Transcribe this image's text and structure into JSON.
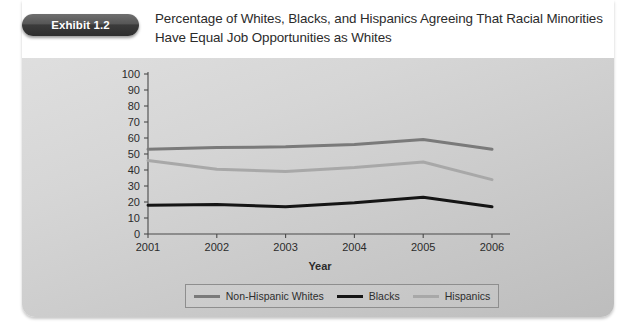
{
  "badge": {
    "label": "Exhibit 1.2"
  },
  "title": {
    "line1": "Percentage of Whites, Blacks, and Hispanics Agreeing That Racial Minorities",
    "line2": "Have Equal Job Opportunities as Whites"
  },
  "colors": {
    "whites": "#7a7a7a",
    "blacks": "#151515",
    "hispanics": "#a8a8a8",
    "axis": "#4a4a4a",
    "text": "#2b2b2b",
    "badge_bg": "#3b3b3b",
    "card_bg": "#d2d2d2"
  },
  "chart_data": {
    "type": "line",
    "title": "",
    "xlabel": "Year",
    "ylabel": "",
    "categories": [
      "2001",
      "2002",
      "2003",
      "2004",
      "2005",
      "2006"
    ],
    "ylim": [
      0,
      100
    ],
    "yticks": [
      0,
      10,
      20,
      30,
      40,
      50,
      60,
      70,
      80,
      90,
      100
    ],
    "ytick_labels": [
      "0",
      "10",
      "20",
      "30",
      "40",
      "50",
      "60",
      "70",
      "80",
      "90",
      "100"
    ],
    "grid": false,
    "legend_position": "bottom",
    "series": [
      {
        "name": "Non-Hispanic Whites",
        "color": "#7a7a7a",
        "width": 3.0,
        "values": [
          53,
          54,
          54.5,
          56,
          59,
          53
        ]
      },
      {
        "name": "Blacks",
        "color": "#151515",
        "width": 3.0,
        "values": [
          18,
          18.5,
          17,
          19.5,
          23,
          17
        ]
      },
      {
        "name": "Hispanics",
        "color": "#a8a8a8",
        "width": 3.0,
        "values": [
          46,
          40.5,
          39,
          41.5,
          45,
          34
        ]
      }
    ]
  }
}
